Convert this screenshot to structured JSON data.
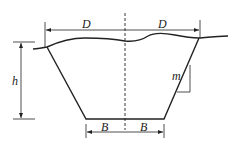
{
  "diagram": {
    "type": "trapezoidal channel cross-section",
    "labels": {
      "top_half_width_left": "D",
      "top_half_width_right": "D",
      "depth": "h",
      "side_slope": "m",
      "bottom_half_width_left": "B",
      "bottom_half_width_right": "B"
    },
    "colors": {
      "line": "#222222",
      "background": "#ffffff"
    }
  }
}
